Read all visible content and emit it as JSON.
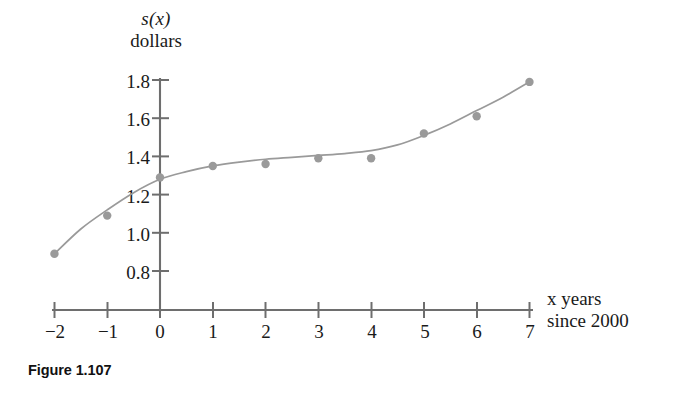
{
  "figure": {
    "caption": "Figure 1.107"
  },
  "chart_data": {
    "type": "scatter",
    "title": "",
    "subtitle": "",
    "xlabel_line1": "x years",
    "xlabel_line2": "since 2000",
    "xlabel": "x years since 2000",
    "ylabel_line1": "s(x)",
    "ylabel_line2": "dollars",
    "ylabel": "s(x) dollars",
    "grid": false,
    "legend": "none",
    "xlim": [
      -2,
      7
    ],
    "ylim": [
      0.7,
      1.85
    ],
    "xticks": [
      -2,
      -1,
      0,
      1,
      2,
      3,
      4,
      5,
      6,
      7
    ],
    "xtick_labels": [
      "−2",
      "−1",
      "0",
      "1",
      "2",
      "3",
      "4",
      "5",
      "6",
      "7"
    ],
    "yticks": [
      0.8,
      1.0,
      1.2,
      1.4,
      1.6,
      1.8
    ],
    "ytick_labels": [
      "0.8",
      "1.0",
      "1.2",
      "1.4",
      "1.6",
      "1.8"
    ],
    "x": [
      -2,
      -1,
      0,
      1,
      2,
      3,
      4,
      5,
      6,
      7
    ],
    "values": [
      0.89,
      1.09,
      1.29,
      1.35,
      1.36,
      1.39,
      1.39,
      1.52,
      1.61,
      1.79
    ],
    "series": [
      {
        "name": "data points",
        "kind": "scatter",
        "marker": "circle",
        "color": "#9a9a9a",
        "x": [
          -2,
          -1,
          0,
          1,
          2,
          3,
          4,
          5,
          6,
          7
        ],
        "values": [
          0.89,
          1.09,
          1.29,
          1.35,
          1.36,
          1.39,
          1.39,
          1.52,
          1.61,
          1.79
        ]
      },
      {
        "name": "fitted curve",
        "kind": "line",
        "color": "#9a9a9a",
        "x": [
          -2,
          -1.5,
          -1,
          -0.5,
          0,
          0.5,
          1,
          1.5,
          2,
          2.5,
          3,
          3.5,
          4,
          4.5,
          5,
          5.5,
          6,
          6.5,
          7
        ],
        "values": [
          0.89,
          1.02,
          1.12,
          1.21,
          1.28,
          1.32,
          1.35,
          1.37,
          1.385,
          1.395,
          1.405,
          1.415,
          1.43,
          1.46,
          1.51,
          1.57,
          1.64,
          1.71,
          1.79
        ]
      }
    ],
    "colors": {
      "axis": "#6e6e6e",
      "marker": "#9a9a9a",
      "curve": "#9a9a9a",
      "text": "#1a1a1a",
      "caption": "#111111",
      "background": "#ffffff"
    }
  }
}
